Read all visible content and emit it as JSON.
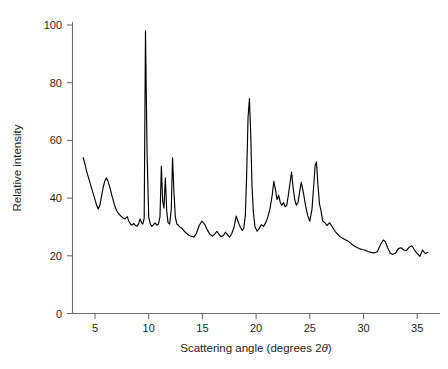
{
  "chart_data": {
    "type": "line",
    "title": "",
    "xlabel": "Scattering angle (degrees 2θ)",
    "ylabel": "Relative intensity",
    "xlim": [
      2.2,
      36.6
    ],
    "ylim": [
      0,
      104
    ],
    "grid": false,
    "legend": null,
    "xticks": [
      5,
      10,
      15,
      20,
      25,
      30,
      35
    ],
    "xtick_labels": [
      "5",
      "10",
      "15",
      "20",
      "25",
      "30",
      "35"
    ],
    "yticks": [
      0,
      20,
      40,
      60,
      80,
      100
    ],
    "ytick_labels": [
      "0",
      "20",
      "40",
      "60",
      "80",
      "100"
    ],
    "series": [
      {
        "name": "X-ray diffraction pattern",
        "color": "#000000",
        "x": [
          3.9,
          4.05,
          4.2,
          4.4,
          4.6,
          4.8,
          5.0,
          5.15,
          5.3,
          5.45,
          5.6,
          5.75,
          5.9,
          6.05,
          6.2,
          6.4,
          6.6,
          6.8,
          7.0,
          7.2,
          7.4,
          7.6,
          7.8,
          8.0,
          8.15,
          8.3,
          8.45,
          8.6,
          8.75,
          8.9,
          9.05,
          9.2,
          9.32,
          9.45,
          9.58,
          9.7,
          9.85,
          10.0,
          10.15,
          10.3,
          10.45,
          10.6,
          10.75,
          10.9,
          11.05,
          11.18,
          11.3,
          11.42,
          11.55,
          11.68,
          11.8,
          11.95,
          12.1,
          12.22,
          12.35,
          12.48,
          12.62,
          12.78,
          12.95,
          13.1,
          13.3,
          13.5,
          13.7,
          13.95,
          14.2,
          14.45,
          14.7,
          14.95,
          15.2,
          15.45,
          15.7,
          15.95,
          16.15,
          16.35,
          16.55,
          16.75,
          16.95,
          17.15,
          17.35,
          17.55,
          17.75,
          17.95,
          18.15,
          18.35,
          18.55,
          18.7,
          18.85,
          19.0,
          19.12,
          19.25,
          19.38,
          19.5,
          19.62,
          19.75,
          19.9,
          20.1,
          20.3,
          20.5,
          20.7,
          20.9,
          21.1,
          21.3,
          21.5,
          21.65,
          21.8,
          21.95,
          22.1,
          22.25,
          22.4,
          22.55,
          22.7,
          22.85,
          23.0,
          23.15,
          23.3,
          23.45,
          23.6,
          23.75,
          23.9,
          24.05,
          24.2,
          24.4,
          24.6,
          24.8,
          25.0,
          25.2,
          25.35,
          25.5,
          25.62,
          25.75,
          25.9,
          26.05,
          26.2,
          26.4,
          26.6,
          26.85,
          27.1,
          27.35,
          27.6,
          27.85,
          28.1,
          28.35,
          28.6,
          28.85,
          29.1,
          29.35,
          29.6,
          29.85,
          30.1,
          30.4,
          30.7,
          31.0,
          31.3,
          31.6,
          31.85,
          32.05,
          32.25,
          32.5,
          32.75,
          33.0,
          33.25,
          33.5,
          33.75,
          34.0,
          34.25,
          34.5,
          34.75,
          35.0,
          35.25,
          35.5,
          35.75,
          36.0
        ],
        "y": [
          54.0,
          52.0,
          49.5,
          47.0,
          44.5,
          42.0,
          39.5,
          37.5,
          36.2,
          37.5,
          40.5,
          43.5,
          45.8,
          47.0,
          46.0,
          43.5,
          40.5,
          37.8,
          35.8,
          34.6,
          33.8,
          33.2,
          32.8,
          33.6,
          32.0,
          31.0,
          30.6,
          31.2,
          30.6,
          30.2,
          31.0,
          32.8,
          31.6,
          31.0,
          33.0,
          98.0,
          55.0,
          33.5,
          31.0,
          30.2,
          30.8,
          31.4,
          30.6,
          31.0,
          33.5,
          51.0,
          39.0,
          36.5,
          47.0,
          35.5,
          31.5,
          31.0,
          36.0,
          54.0,
          42.0,
          33.5,
          31.0,
          30.5,
          29.8,
          29.5,
          28.6,
          27.8,
          27.2,
          26.8,
          26.5,
          27.8,
          30.5,
          32.0,
          31.0,
          29.0,
          27.5,
          26.8,
          27.5,
          28.5,
          27.4,
          26.6,
          27.0,
          28.2,
          27.2,
          26.5,
          27.8,
          30.0,
          33.8,
          31.5,
          29.8,
          28.8,
          29.5,
          34.0,
          48.0,
          68.0,
          74.5,
          62.0,
          44.0,
          35.0,
          30.0,
          28.5,
          29.5,
          30.8,
          30.2,
          31.5,
          33.5,
          36.5,
          41.0,
          45.8,
          43.0,
          39.5,
          41.0,
          38.5,
          37.5,
          38.5,
          37.0,
          37.5,
          41.0,
          45.0,
          49.0,
          43.5,
          39.5,
          37.5,
          38.5,
          42.0,
          45.5,
          42.0,
          37.5,
          34.0,
          32.0,
          36.0,
          43.5,
          51.5,
          52.5,
          45.0,
          38.0,
          35.5,
          32.0,
          31.5,
          30.5,
          31.5,
          30.0,
          28.5,
          27.5,
          26.5,
          26.0,
          25.5,
          25.0,
          24.2,
          23.5,
          23.0,
          22.5,
          22.2,
          22.0,
          21.5,
          21.2,
          21.0,
          21.5,
          24.0,
          25.5,
          24.8,
          22.8,
          20.8,
          20.5,
          21.0,
          22.5,
          22.8,
          22.0,
          21.8,
          23.0,
          23.5,
          22.0,
          20.8,
          19.8,
          22.0,
          20.8,
          21.2
        ]
      }
    ]
  }
}
